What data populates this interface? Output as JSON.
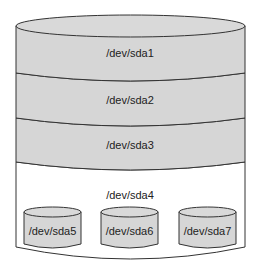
{
  "diagram": {
    "colors": {
      "primary_fill": "#d6d6d6",
      "extended_fill": "#ffffff",
      "logical_fill": "#d6d6d6",
      "stroke": "#333333"
    },
    "disk": {
      "primary_partitions": [
        {
          "name": "/dev/sda1"
        },
        {
          "name": "/dev/sda2"
        },
        {
          "name": "/dev/sda3"
        }
      ],
      "extended_partition": {
        "name": "/dev/sda4",
        "logical_partitions": [
          {
            "name": "/dev/sda5"
          },
          {
            "name": "/dev/sda6"
          },
          {
            "name": "/dev/sda7"
          }
        ]
      }
    }
  }
}
